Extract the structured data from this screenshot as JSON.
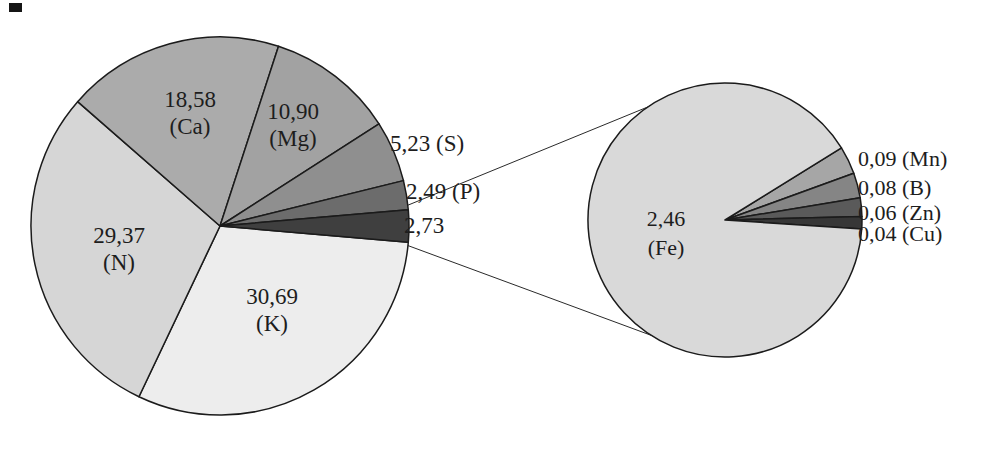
{
  "figure": {
    "background_color": "#ffffff",
    "stroke_color": "#1b1b1b",
    "text_color": "#1d1d1d"
  },
  "chart_data": {
    "type": "pie",
    "subtype": "pie-of-pie",
    "decimal_style": "comma",
    "title": "",
    "legend": "none",
    "main_pie": {
      "total": 100,
      "start_angle_cw_from_3oclock": 4.9,
      "direction": "clockwise",
      "slices": [
        {
          "element": "K",
          "value": 30.69,
          "value_label": "30,69",
          "name_label": "(K)",
          "color": "#ededed",
          "label_placement": "inside"
        },
        {
          "element": "N",
          "value": 29.37,
          "value_label": "29,37",
          "name_label": "(N)",
          "color": "#d6d6d6",
          "label_placement": "inside"
        },
        {
          "element": "Ca",
          "value": 18.58,
          "value_label": "18,58",
          "name_label": "(Ca)",
          "color": "#ababab",
          "label_placement": "inside"
        },
        {
          "element": "Mg",
          "value": 10.9,
          "value_label": "10,90",
          "name_label": "(Mg)",
          "color": "#a2a2a2",
          "label_placement": "inside"
        },
        {
          "element": "S",
          "value": 5.23,
          "value_label": "5,23 (S)",
          "name_label": "",
          "color": "#8f8f8f",
          "label_placement": "outside"
        },
        {
          "element": "P",
          "value": 2.49,
          "value_label": "2,49 (P)",
          "name_label": "",
          "color": "#6c6c6c",
          "label_placement": "outside"
        },
        {
          "element": "Other",
          "value": 2.73,
          "value_label": "2,73",
          "name_label": "",
          "color": "#3f3f3f",
          "label_placement": "outside"
        }
      ]
    },
    "secondary_pie": {
      "total": 2.73,
      "start_angle_cw_from_3oclock": -31.8,
      "direction": "clockwise",
      "slices": [
        {
          "element": "Mn",
          "value": 0.09,
          "value_label": "0,09 (Mn)",
          "name_label": "",
          "color": "#a6a6a6",
          "label_placement": "outside"
        },
        {
          "element": "B",
          "value": 0.08,
          "value_label": "0,08 (B)",
          "name_label": "",
          "color": "#858585",
          "label_placement": "outside"
        },
        {
          "element": "Zn",
          "value": 0.06,
          "value_label": "0,06 (Zn)",
          "name_label": "",
          "color": "#5a5a5a",
          "label_placement": "outside"
        },
        {
          "element": "Cu",
          "value": 0.04,
          "value_label": "0,04 (Cu)",
          "name_label": "",
          "color": "#373737",
          "label_placement": "outside"
        },
        {
          "element": "Fe",
          "value": 2.46,
          "value_label": "2,46",
          "name_label": "(Fe)",
          "color": "#d9d9d9",
          "label_placement": "inside"
        }
      ]
    }
  }
}
